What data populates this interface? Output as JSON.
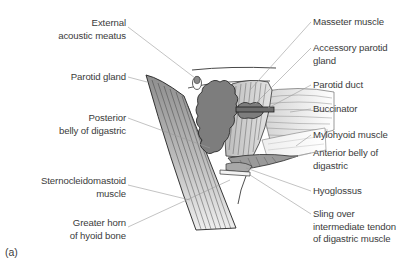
{
  "figure": {
    "panel_label": "(a)"
  },
  "labels": {
    "left": [
      {
        "id": "external-acoustic-meatus",
        "lines": [
          "External",
          "acoustic meatus"
        ]
      },
      {
        "id": "parotid-gland",
        "lines": [
          "Parotid gland"
        ]
      },
      {
        "id": "posterior-belly-of-digastric",
        "lines": [
          "Posterior",
          "belly of digastric"
        ]
      },
      {
        "id": "sternocleidomastoid-muscle",
        "lines": [
          "Sternocleidomastoid",
          "muscle"
        ]
      },
      {
        "id": "greater-horn-of-hyoid-bone",
        "lines": [
          "Greater horn",
          "of hyoid bone"
        ]
      }
    ],
    "right": [
      {
        "id": "masseter-muscle",
        "lines": [
          "Masseter muscle"
        ]
      },
      {
        "id": "accessory-parotid-gland",
        "lines": [
          "Accessory parotid",
          "gland"
        ]
      },
      {
        "id": "parotid-duct",
        "lines": [
          "Parotid duct"
        ]
      },
      {
        "id": "buccinator",
        "lines": [
          "Buccinator"
        ]
      },
      {
        "id": "mylohyoid-muscle",
        "lines": [
          "Mylohyoid muscle"
        ]
      },
      {
        "id": "anterior-belly-of-digastric",
        "lines": [
          "Anterior belly of",
          "digastric"
        ]
      },
      {
        "id": "hyoglossus",
        "lines": [
          "Hyoglossus"
        ]
      },
      {
        "id": "sling-over-intermediate-tendon",
        "lines": [
          "Sling over",
          "intermediate tendon",
          "of digastric muscle"
        ]
      }
    ]
  },
  "colors": {
    "gland": "#7a7a7a",
    "muscle_light": "#d6d6d6",
    "muscle_mid": "#a8a8a8",
    "outline": "#2a2a2a",
    "leader": "#9a9a9a",
    "text": "#3b3b3b"
  }
}
